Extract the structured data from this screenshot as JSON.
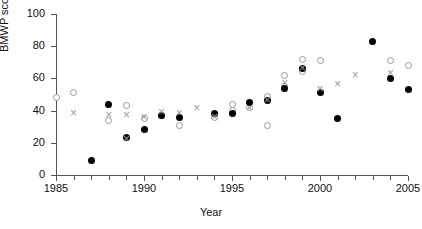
{
  "chart_data": {
    "type": "scatter",
    "title": "",
    "xlabel": "Year",
    "ylabel": "BMWP score",
    "xlim": [
      1985,
      2005
    ],
    "ylim": [
      0,
      100
    ],
    "xticks": [
      1985,
      1986,
      1987,
      1988,
      1989,
      1990,
      1991,
      1992,
      1993,
      1994,
      1995,
      1996,
      1997,
      1998,
      1999,
      2000,
      2001,
      2002,
      2003,
      2004,
      2005
    ],
    "xticklabels": [
      "1985",
      "",
      "",
      "",
      "",
      "1990",
      "",
      "",
      "",
      "",
      "1995",
      "",
      "",
      "",
      "",
      "2000",
      "",
      "",
      "",
      "",
      "2005"
    ],
    "yticks": [
      0,
      20,
      40,
      60,
      80,
      100
    ],
    "yticklabels": [
      "0",
      "20",
      "40",
      "60",
      "80",
      "100"
    ],
    "grid": false,
    "legend": "none",
    "series": [
      {
        "name": "open-circle",
        "marker": "open-circle",
        "color": "#999999",
        "points": [
          {
            "x": 1985,
            "y": 48
          },
          {
            "x": 1986,
            "y": 51
          },
          {
            "x": 1988,
            "y": 34
          },
          {
            "x": 1989,
            "y": 43
          },
          {
            "x": 1990,
            "y": 35
          },
          {
            "x": 1991,
            "y": 37
          },
          {
            "x": 1992,
            "y": 31
          },
          {
            "x": 1994,
            "y": 36
          },
          {
            "x": 1995,
            "y": 40
          },
          {
            "x": 1995,
            "y": 44
          },
          {
            "x": 1996,
            "y": 42
          },
          {
            "x": 1997,
            "y": 31
          },
          {
            "x": 1997,
            "y": 49
          },
          {
            "x": 1998,
            "y": 55
          },
          {
            "x": 1998,
            "y": 62
          },
          {
            "x": 1999,
            "y": 72
          },
          {
            "x": 1999,
            "y": 64
          },
          {
            "x": 2000,
            "y": 71
          },
          {
            "x": 2004,
            "y": 71
          },
          {
            "x": 2005,
            "y": 68
          }
        ]
      },
      {
        "name": "filled-circle",
        "marker": "filled-circle",
        "color": "#000000",
        "points": [
          {
            "x": 1987,
            "y": 9
          },
          {
            "x": 1988,
            "y": 44
          },
          {
            "x": 1989,
            "y": 23
          },
          {
            "x": 1990,
            "y": 28
          },
          {
            "x": 1991,
            "y": 37
          },
          {
            "x": 1992,
            "y": 36
          },
          {
            "x": 1994,
            "y": 38
          },
          {
            "x": 1995,
            "y": 38
          },
          {
            "x": 1996,
            "y": 45
          },
          {
            "x": 1997,
            "y": 46
          },
          {
            "x": 1998,
            "y": 54
          },
          {
            "x": 1999,
            "y": 66
          },
          {
            "x": 2000,
            "y": 51
          },
          {
            "x": 2001,
            "y": 35
          },
          {
            "x": 2003,
            "y": 83
          },
          {
            "x": 2004,
            "y": 60
          },
          {
            "x": 2005,
            "y": 53
          }
        ]
      },
      {
        "name": "cross",
        "marker": "cross",
        "color": "#9a9a9a",
        "points": [
          {
            "x": 1986,
            "y": 38
          },
          {
            "x": 1988,
            "y": 37
          },
          {
            "x": 1989,
            "y": 37
          },
          {
            "x": 1989,
            "y": 22
          },
          {
            "x": 1990,
            "y": 36
          },
          {
            "x": 1991,
            "y": 39
          },
          {
            "x": 1992,
            "y": 38
          },
          {
            "x": 1993,
            "y": 41
          },
          {
            "x": 1994,
            "y": 36
          },
          {
            "x": 1996,
            "y": 41
          },
          {
            "x": 1997,
            "y": 46
          },
          {
            "x": 1998,
            "y": 57
          },
          {
            "x": 1999,
            "y": 66
          },
          {
            "x": 2000,
            "y": 53
          },
          {
            "x": 2001,
            "y": 56
          },
          {
            "x": 2002,
            "y": 62
          },
          {
            "x": 2004,
            "y": 63
          }
        ]
      }
    ]
  }
}
